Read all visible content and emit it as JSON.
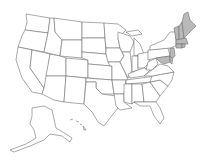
{
  "map": {
    "type": "us-states-choropleth",
    "highlight_color": "#b9b9b9",
    "base_color": "#ffffff",
    "stroke_color": "#6f6f6f",
    "highlighted_states": [
      "ME",
      "NH",
      "VT",
      "MA",
      "RI",
      "CT",
      "NJ",
      "DE",
      "MD"
    ],
    "insets": [
      "AK",
      "HI"
    ]
  }
}
